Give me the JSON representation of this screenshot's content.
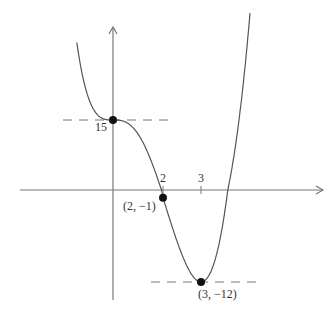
{
  "chart_data": {
    "type": "line",
    "title": "",
    "xlabel": "",
    "ylabel": "",
    "function_sketch": "y = x^4 - 4x^3 + 15",
    "x_ticks": [
      {
        "value": 2,
        "label": "2"
      },
      {
        "value": 3,
        "label": "3"
      }
    ],
    "y_ticks": [
      {
        "value": 15,
        "label": "15"
      }
    ],
    "series": [
      {
        "name": "curve",
        "x": [
          -1.45,
          -1,
          -0.5,
          0,
          0.5,
          1,
          1.5,
          2,
          2.5,
          3,
          3.5,
          4,
          4.3
        ],
        "y": [
          27.2,
          20,
          15.56,
          15,
          14.56,
          12,
          6.56,
          -1,
          -8.44,
          -12,
          -6.44,
          15,
          34.4
        ]
      }
    ],
    "points": [
      {
        "x": 0,
        "y": 15,
        "label": "15",
        "role": "inflection"
      },
      {
        "x": 2,
        "y": -1,
        "label": "(2, −1)",
        "role": "inflection"
      },
      {
        "x": 3,
        "y": -12,
        "label": "(3, −12)",
        "role": "minimum"
      }
    ],
    "dashed_levels": [
      15,
      -12
    ],
    "grid": false,
    "legend": "none"
  }
}
